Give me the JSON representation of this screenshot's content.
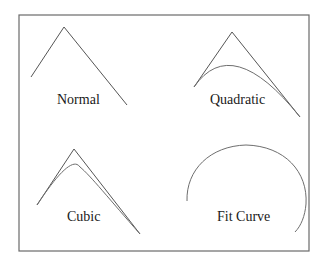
{
  "diagram": {
    "frame": {
      "x": 19,
      "y": 15,
      "width": 290,
      "height": 236
    },
    "panels": [
      {
        "id": "normal",
        "label": "Normal",
        "label_pos": [
          57,
          104
        ],
        "polyline": "31,77 64,27 127,105",
        "curve": ""
      },
      {
        "id": "quadratic",
        "label": "Quadratic",
        "label_pos": [
          210,
          104
        ],
        "polyline": "194,87 232,32 300,117",
        "curve": "M194,87 Q232,32 300,117"
      },
      {
        "id": "cubic",
        "label": "Cubic",
        "label_pos": [
          67,
          221
        ],
        "polyline": "37,205 74,149 140,234",
        "curve": "M37,205 C60,170 74,158 80,167 C90,175 110,200 140,234"
      },
      {
        "id": "fit-curve",
        "label": "Fit Curve",
        "label_pos": [
          217,
          221
        ],
        "polyline": "",
        "curve": "M187,201 C186,170 210,146 246,145 C285,146 308,172 306,204 C305,216 301,226 295,232"
      }
    ]
  }
}
